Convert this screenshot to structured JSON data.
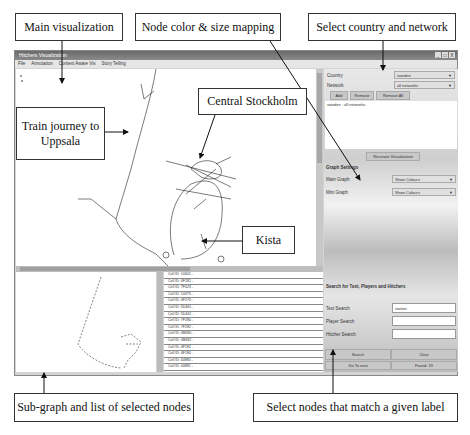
{
  "callouts": {
    "main_vis": "Main visualization",
    "node_mapping": "Node color & size mapping",
    "select_country": "Select country and network",
    "train": "Train journey to Uppsala",
    "central": "Central Stockholm",
    "kista": "Kista",
    "subgraph": "Sub-graph and list of selected nodes",
    "select_nodes": "Select nodes that match a given label"
  },
  "window": {
    "title": "Hitchers Visualization",
    "controls": [
      "_",
      "□",
      "X"
    ],
    "menu": [
      "File",
      "Annotation",
      "Context Aware Vis",
      "Story Telling"
    ]
  },
  "panel": {
    "country_label": "Country",
    "country_value": "sweden",
    "network_label": "Network",
    "network_value": "all networks",
    "add": "Add",
    "remove": "Remove",
    "remove_all": "Remove All",
    "selected_item": "sweden : all networks",
    "recreate": "Recreate Visualization",
    "graph_settings": "Graph Settings",
    "main_graph_label": "Main Graph",
    "main_graph_value": "Show Colours",
    "mini_graph_label": "Mini Graph",
    "mini_graph_value": "Show Colours",
    "search_title": "Search for Text, Players and Hitchers",
    "text_search_label": "Text Search",
    "text_search_value": "station",
    "player_search_label": "Player Search",
    "player_search_value": "",
    "hitcher_search_label": "Hitcher Search",
    "hitcher_search_value": "",
    "search_btn": "Search",
    "clear_btn": "Clear",
    "goto_next": "Go To next",
    "found": "Found: 19"
  },
  "cell_list": [
    "Cell ID: 14401 -",
    "Cell ID: 4F281 -",
    "Cell ID: 7F023 -",
    "Cell ID: 14473 -",
    "Cell ID: 4F270 -",
    "Cell ID: 5D461 -",
    "Cell ID: 5D441 -",
    "Cell ID: 7F280 -",
    "Cell ID: 7F282 -",
    "Cell ID: 4B680 -",
    "Cell ID: 4B682 -",
    "Cell ID: 4F181 -",
    "Cell ID: 4F180 -",
    "Cell ID: 44880 -",
    "Cell ID: 44881 -"
  ]
}
